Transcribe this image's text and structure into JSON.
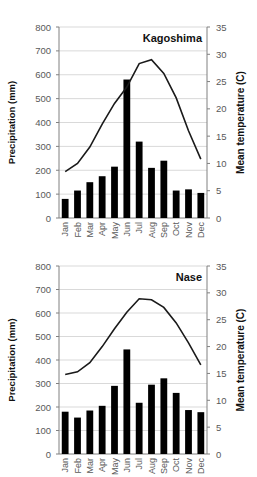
{
  "chart_data": [
    {
      "type": "bar+line",
      "title": "Kagoshima",
      "categories": [
        "Jan",
        "Feb",
        "Mar",
        "Apr",
        "May",
        "Jun",
        "Jul",
        "Aug",
        "Sep",
        "Oct",
        "Nov",
        "Dec"
      ],
      "series": [
        {
          "name": "Precipitation (mm)",
          "type": "bar",
          "axis": "left",
          "values": [
            80,
            115,
            150,
            175,
            215,
            580,
            320,
            210,
            240,
            115,
            120,
            105
          ]
        },
        {
          "name": "Mean temperature (C)",
          "type": "line",
          "axis": "right",
          "values": [
            8.5,
            10.0,
            13.0,
            17.2,
            21.0,
            24.0,
            28.3,
            29.0,
            26.5,
            22.0,
            16.0,
            10.8
          ]
        }
      ],
      "ylabel": "Precipitation (mm)",
      "y2label": "Mean temperature (C)",
      "ylim": [
        0,
        800
      ],
      "y2lim": [
        0,
        35
      ],
      "yticks": [
        0,
        100,
        200,
        300,
        400,
        500,
        600,
        700,
        800
      ],
      "y2ticks": [
        0,
        5,
        10,
        15,
        20,
        25,
        30,
        35
      ],
      "grid": true
    },
    {
      "type": "bar+line",
      "title": "Nase",
      "categories": [
        "Jan",
        "Feb",
        "Mar",
        "Apr",
        "May",
        "Jun",
        "Jul",
        "Aug",
        "Sep",
        "Oct",
        "Nov",
        "Dec"
      ],
      "series": [
        {
          "name": "Precipitation (mm)",
          "type": "bar",
          "axis": "left",
          "values": [
            180,
            155,
            185,
            205,
            290,
            445,
            218,
            295,
            322,
            260,
            187,
            178
          ]
        },
        {
          "name": "Mean temperature (C)",
          "type": "line",
          "axis": "right",
          "values": [
            14.8,
            15.3,
            17.0,
            20.0,
            23.3,
            26.4,
            28.9,
            28.7,
            27.3,
            24.4,
            20.7,
            16.6
          ]
        }
      ],
      "ylabel": "Precipitation (mm)",
      "y2label": "Mean temperature (C)",
      "ylim": [
        0,
        800
      ],
      "y2lim": [
        0,
        35
      ],
      "yticks": [
        0,
        100,
        200,
        300,
        400,
        500,
        600,
        700,
        800
      ],
      "y2ticks": [
        0,
        5,
        10,
        15,
        20,
        25,
        30,
        35
      ],
      "grid": true
    }
  ],
  "colors": {
    "bar": "#000000",
    "line": "#1a1a1a",
    "grid": "#d9d9d9",
    "axis": "#808080",
    "tick_text": "#595959"
  }
}
